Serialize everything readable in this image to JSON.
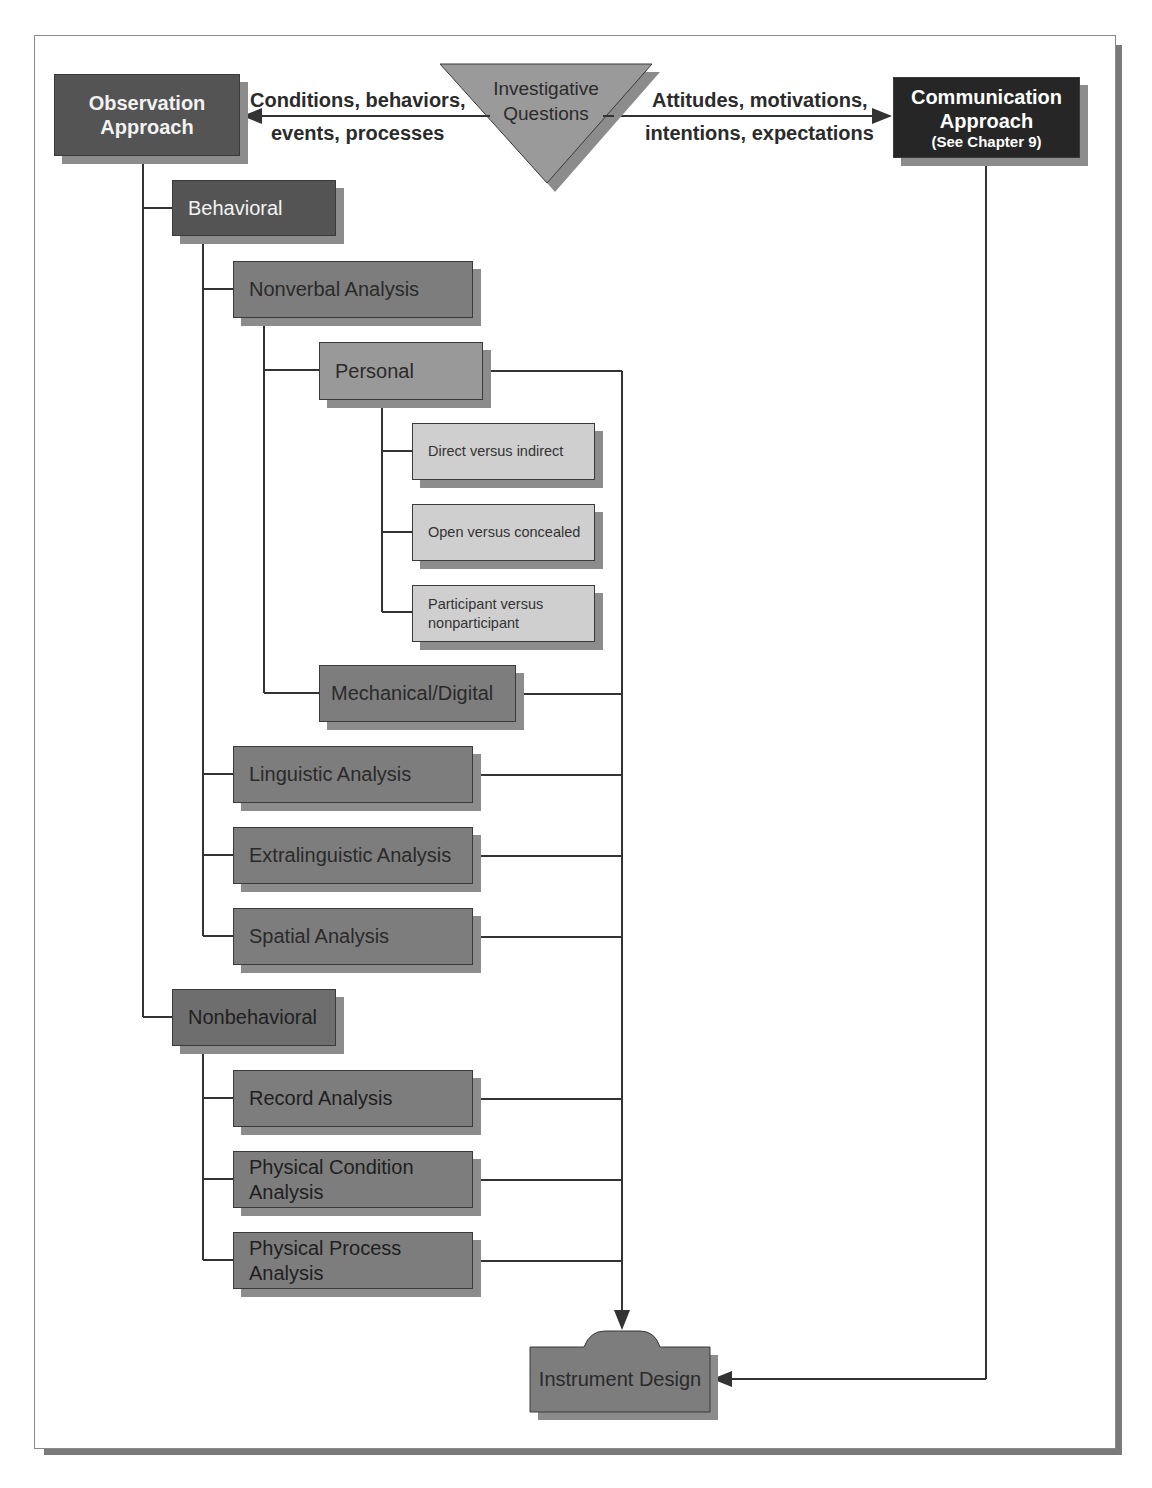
{
  "diagram": {
    "top": {
      "observation": {
        "line1": "Observation",
        "line2": "Approach"
      },
      "investigative": {
        "line1": "Investigative",
        "line2": "Questions"
      },
      "communication": {
        "line1": "Communication",
        "line2": "Approach",
        "note": "(See Chapter 9)"
      },
      "left_arrow_label": {
        "line1": "Conditions, behaviors,",
        "line2": "events, processes"
      },
      "right_arrow_label": {
        "line1": "Attitudes, motivations,",
        "line2": "intentions, expectations"
      }
    },
    "behavioral": {
      "label": "Behavioral",
      "nonverbal": {
        "label": "Nonverbal Analysis",
        "personal": {
          "label": "Personal",
          "options": [
            {
              "label": "Direct versus indirect"
            },
            {
              "label": "Open versus concealed"
            },
            {
              "line1": "Participant versus",
              "line2": "nonparticipant"
            }
          ]
        },
        "mechanical": {
          "label": "Mechanical/Digital"
        }
      },
      "linguistic": {
        "label": "Linguistic Analysis"
      },
      "extralinguistic": {
        "label": "Extralinguistic Analysis"
      },
      "spatial": {
        "label": "Spatial Analysis"
      }
    },
    "nonbehavioral": {
      "label": "Nonbehavioral",
      "record": {
        "label": "Record Analysis"
      },
      "physical_condition": {
        "line1": "Physical Condition",
        "line2": "Analysis"
      },
      "physical_process": {
        "line1": "Physical Process",
        "line2": "Analysis"
      }
    },
    "instrument_design": {
      "label": "Instrument Design"
    },
    "colors": {
      "dark_box": "#545454",
      "black_box": "#262626",
      "mid_box": "#7d7d7d",
      "light_box": "#cfcfcf",
      "shadow": "#8c8c8c",
      "line": "#333333"
    }
  }
}
